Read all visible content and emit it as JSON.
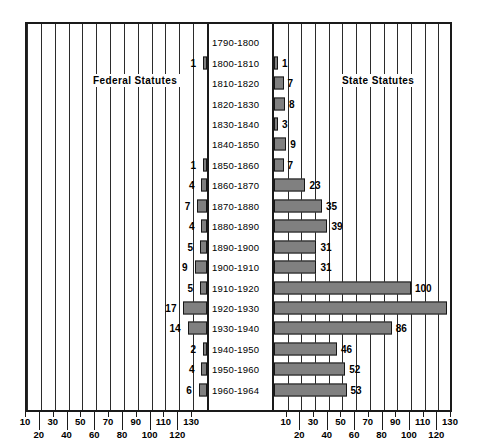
{
  "chart_data": {
    "type": "bar",
    "subtype": "population-pyramid",
    "title": "",
    "xlabel": "",
    "ylabel": "",
    "orientation": "horizontal-diverging",
    "categories": [
      "1790-1800",
      "1800-1810",
      "1810-1820",
      "1820-1830",
      "1830-1840",
      "1840-1850",
      "1850-1860",
      "1860-1870",
      "1870-1880",
      "1880-1890",
      "1890-1900",
      "1900-1910",
      "1910-1920",
      "1920-1930",
      "1930-1940",
      "1940-1950",
      "1950-1960",
      "1960-1964"
    ],
    "series": [
      {
        "name": "Federal Statutes",
        "side": "left",
        "values": [
          0,
          1,
          0,
          0,
          0,
          0,
          1,
          4,
          7,
          4,
          5,
          9,
          5,
          17,
          14,
          2,
          4,
          6
        ]
      },
      {
        "name": "State Statutes",
        "side": "right",
        "values": [
          0,
          1,
          7,
          8,
          3,
          9,
          7,
          23,
          35,
          39,
          31,
          31,
          100,
          126,
          86,
          46,
          52,
          53
        ]
      }
    ],
    "xlim": [
      0,
      130
    ],
    "x_ticks_major": [
      10,
      30,
      50,
      70,
      90,
      110,
      130
    ],
    "x_ticks_minor": [
      20,
      40,
      60,
      80,
      100,
      120
    ],
    "gridlines": true,
    "legend_position": "inside-top",
    "colors": {
      "bar_fill": "#808080",
      "bar_outline": "#161616",
      "frame": "#1a1a1a",
      "background": "#ffffff",
      "text": "#000000"
    }
  },
  "headings": {
    "left": "Federal Statutes",
    "right": "State Statutes"
  },
  "axis": {
    "left_row_top": [
      "130",
      "110",
      "90",
      "70",
      "50",
      "30",
      "10"
    ],
    "left_row_bottom": [
      "120",
      "100",
      "80",
      "60",
      "40",
      "20"
    ],
    "right_row_top": [
      "10",
      "30",
      "50",
      "70",
      "90",
      "110",
      "130"
    ],
    "right_row_bottom": [
      "20",
      "40",
      "60",
      "80",
      "100",
      "120"
    ]
  }
}
